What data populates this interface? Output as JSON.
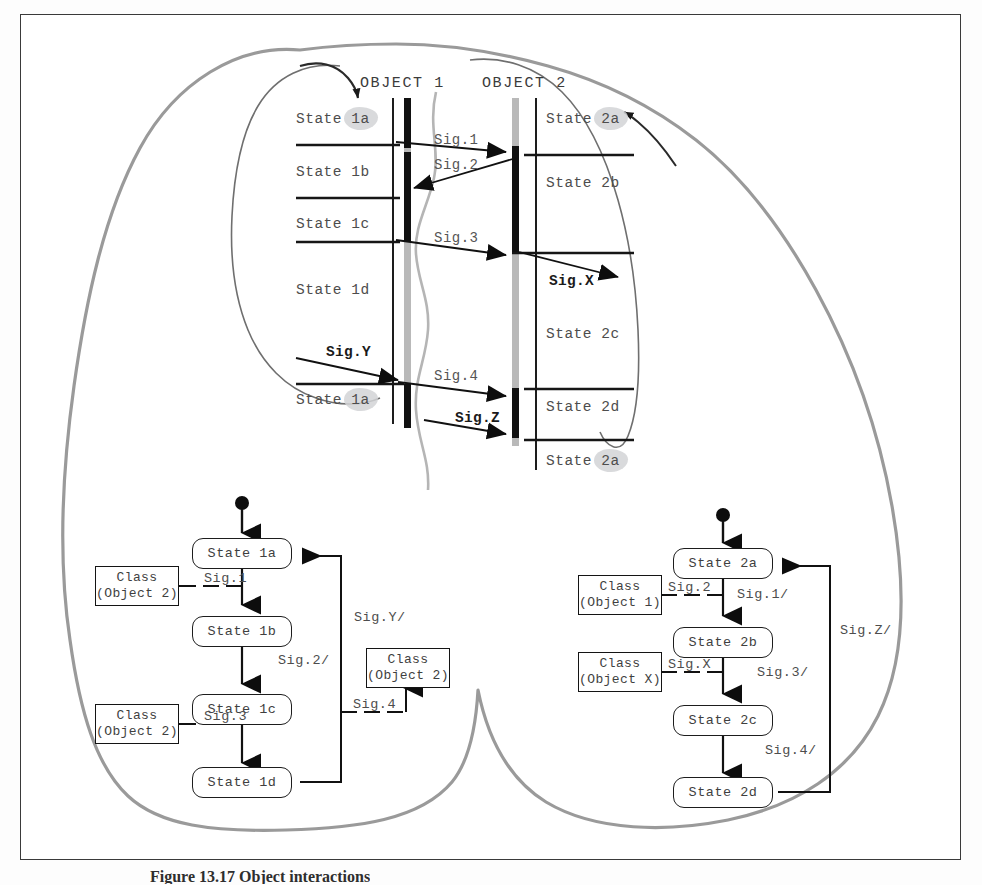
{
  "figure": {
    "caption": "Figure 13.17  Object interactions",
    "page_background": "#fdfdfd",
    "frame_color": "#3a3a3a",
    "ink_color": "#4d4d4d",
    "blob_outer_color": "#9a9a9a",
    "blob_inner_color": "#6f6f6f",
    "highlight_color": "#d2d4d6"
  },
  "sequence_diagram": {
    "objects": [
      {
        "label": "OBJECT 1",
        "id": "object-1"
      },
      {
        "label": "OBJECT 2",
        "id": "object-2"
      }
    ],
    "object1_states": [
      "State 1a",
      "State 1b",
      "State 1c",
      "State 1d",
      "State 1a"
    ],
    "object1_state_parts": [
      {
        "prefix": "State ",
        "suffix": "1a",
        "highlighted": true
      },
      {
        "prefix": "State ",
        "suffix": "1b",
        "highlighted": false
      },
      {
        "prefix": "State ",
        "suffix": "1c",
        "highlighted": false
      },
      {
        "prefix": "State ",
        "suffix": "1d",
        "highlighted": false
      },
      {
        "prefix": "State ",
        "suffix": "1a",
        "highlighted": true
      }
    ],
    "object2_states": [
      "State 2a",
      "State 2b",
      "State 2c",
      "State 2d",
      "State 2a"
    ],
    "object2_state_parts": [
      {
        "prefix": "State ",
        "suffix": "2a",
        "highlighted": true
      },
      {
        "prefix": "State ",
        "suffix": "2b",
        "highlighted": false
      },
      {
        "prefix": "State ",
        "suffix": "2c",
        "highlighted": false
      },
      {
        "prefix": "State ",
        "suffix": "2d",
        "highlighted": false
      },
      {
        "prefix": "State ",
        "suffix": "2a",
        "highlighted": true
      }
    ],
    "messages": [
      {
        "label": "Sig.1",
        "from": "object-1",
        "to": "object-2",
        "emphasis": "normal"
      },
      {
        "label": "Sig.2",
        "from": "object-2",
        "to": "object-1",
        "emphasis": "normal"
      },
      {
        "label": "Sig.3",
        "from": "object-1",
        "to": "object-2",
        "emphasis": "normal"
      },
      {
        "label": "Sig.X",
        "from": "object-2",
        "to": "external",
        "emphasis": "bold"
      },
      {
        "label": "Sig.Y",
        "from": "external",
        "to": "object-1",
        "emphasis": "bold"
      },
      {
        "label": "Sig.4",
        "from": "object-1",
        "to": "object-2",
        "emphasis": "normal"
      },
      {
        "label": "Sig.Z",
        "from": "external",
        "to": "object-2",
        "emphasis": "bold"
      }
    ]
  },
  "state_machine_object1": {
    "title_id": "state-machine-object-1",
    "states": [
      {
        "label": "State 1a"
      },
      {
        "label": "State 1b"
      },
      {
        "label": "State 1c"
      },
      {
        "label": "State 1d"
      }
    ],
    "sent_signals": [
      {
        "label": "Sig.1",
        "target_line1": "Class",
        "target_line2": "(Object 2)"
      },
      {
        "label": "Sig.3",
        "target_line1": "Class",
        "target_line2": "(Object 2)"
      },
      {
        "label": "Sig.4",
        "target_line1": "Class",
        "target_line2": "(Object 2)"
      }
    ],
    "transitions": [
      {
        "label": "Sig.2/"
      },
      {
        "label": "Sig.Y/"
      }
    ]
  },
  "state_machine_object2": {
    "title_id": "state-machine-object-2",
    "states": [
      {
        "label": "State 2a"
      },
      {
        "label": "State 2b"
      },
      {
        "label": "State 2c"
      },
      {
        "label": "State 2d"
      }
    ],
    "sent_signals": [
      {
        "label": "Sig.2",
        "target_line1": "Class",
        "target_line2": "(Object 1)"
      },
      {
        "label": "Sig.X",
        "target_line1": "Class",
        "target_line2": "(Object X)"
      }
    ],
    "transitions": [
      {
        "label": "Sig.1/"
      },
      {
        "label": "Sig.3/"
      },
      {
        "label": "Sig.4/"
      },
      {
        "label": "Sig.Z/"
      }
    ]
  }
}
